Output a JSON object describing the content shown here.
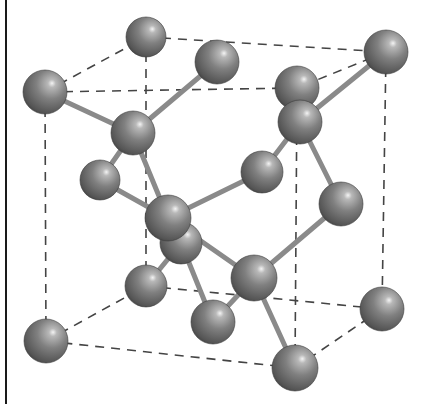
{
  "figure": {
    "colors": {
      "background": "#ffffff",
      "atom_base": "#7d7d7d",
      "atom_edge": "#3c3c3c",
      "atom_highlight": "#f2f2f2",
      "bond": "#8a8a8a",
      "cell_edge": "#444444",
      "frame": "#1a1a1a"
    },
    "atom_radius": 22,
    "atoms": [
      {
        "id": "A",
        "role": "corner",
        "x": 45,
        "y": 92,
        "r": 22
      },
      {
        "id": "B",
        "role": "corner",
        "x": 146,
        "y": 37,
        "r": 20
      },
      {
        "id": "R",
        "role": "corner",
        "x": 386,
        "y": 52,
        "r": 22
      },
      {
        "id": "C",
        "role": "face-center",
        "x": 217,
        "y": 62,
        "r": 22
      },
      {
        "id": "D",
        "role": "face-center",
        "x": 297,
        "y": 88,
        "r": 22
      },
      {
        "id": "E",
        "role": "interior",
        "x": 300,
        "y": 122,
        "r": 22
      },
      {
        "id": "F",
        "role": "interior",
        "x": 133,
        "y": 133,
        "r": 22
      },
      {
        "id": "G",
        "role": "face-center",
        "x": 100,
        "y": 180,
        "r": 20
      },
      {
        "id": "I",
        "role": "face-center",
        "x": 262,
        "y": 172,
        "r": 21
      },
      {
        "id": "J",
        "role": "face-center",
        "x": 341,
        "y": 204,
        "r": 22
      },
      {
        "id": "K",
        "role": "face-center",
        "x": 181,
        "y": 243,
        "r": 21
      },
      {
        "id": "H",
        "role": "interior",
        "x": 168,
        "y": 218,
        "r": 23
      },
      {
        "id": "M",
        "role": "corner",
        "x": 146,
        "y": 286,
        "r": 21
      },
      {
        "id": "L",
        "role": "interior",
        "x": 254,
        "y": 278,
        "r": 23
      },
      {
        "id": "N",
        "role": "face-center",
        "x": 213,
        "y": 322,
        "r": 22
      },
      {
        "id": "P",
        "role": "corner",
        "x": 382,
        "y": 309,
        "r": 22
      },
      {
        "id": "O",
        "role": "corner",
        "x": 46,
        "y": 341,
        "r": 22
      },
      {
        "id": "Q",
        "role": "corner",
        "x": 295,
        "y": 368,
        "r": 23
      }
    ],
    "bonds": [
      [
        "A",
        "F"
      ],
      [
        "C",
        "F"
      ],
      [
        "G",
        "F"
      ],
      [
        "H",
        "F"
      ],
      [
        "R",
        "E"
      ],
      [
        "D",
        "E"
      ],
      [
        "I",
        "E"
      ],
      [
        "J",
        "E"
      ],
      [
        "G",
        "H"
      ],
      [
        "I",
        "H"
      ],
      [
        "K",
        "H"
      ],
      [
        "L",
        "H"
      ],
      [
        "J",
        "L"
      ],
      [
        "Q",
        "L"
      ],
      [
        "N",
        "L"
      ],
      [
        "M",
        "K"
      ],
      [
        "N",
        "K"
      ]
    ],
    "cell_edges": [
      [
        "A",
        "B"
      ],
      [
        "B",
        "R"
      ],
      [
        "R",
        "D"
      ],
      [
        "D",
        "A"
      ],
      [
        "O",
        "M"
      ],
      [
        "M",
        "P"
      ],
      [
        "P",
        "Q"
      ],
      [
        "Q",
        "O"
      ],
      [
        "A",
        "O"
      ],
      [
        "B",
        "M"
      ],
      [
        "R",
        "P"
      ],
      [
        "D",
        "Q"
      ]
    ]
  }
}
